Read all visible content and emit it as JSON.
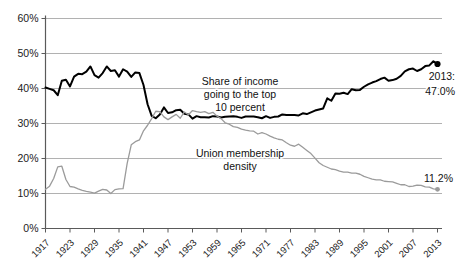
{
  "chart_data": {
    "type": "line",
    "title": "",
    "xlabel": "",
    "ylabel": "",
    "ylim": [
      0,
      60
    ],
    "xlim": [
      1917,
      2013
    ],
    "grid": true,
    "y_tick_labels": [
      "0%",
      "10%",
      "20%",
      "30%",
      "40%",
      "50%",
      "60%"
    ],
    "y_ticks": [
      0,
      10,
      20,
      30,
      40,
      50,
      60
    ],
    "x_ticks": [
      1917,
      1923,
      1929,
      1935,
      1941,
      1947,
      1953,
      1959,
      1965,
      1971,
      1977,
      1983,
      1989,
      1995,
      2001,
      2007,
      2013
    ],
    "x_tick_labels": [
      "1917",
      "1923",
      "1929",
      "1935",
      "1941",
      "1947",
      "1953",
      "1959",
      "1965",
      "1971",
      "1977",
      "1983",
      "1989",
      "1995",
      "2001",
      "2007",
      "2013"
    ],
    "legend_position": "inline-annotations",
    "series": [
      {
        "name": "Share of income going to the top 10 percent",
        "color": "#000000",
        "width": 2.0,
        "annotation": "Share of income\ngoing to the top\n10 percent",
        "end_marker": true,
        "end_label": [
          "2013:",
          "47.0%"
        ],
        "x": [
          1917,
          1918,
          1919,
          1920,
          1921,
          1922,
          1923,
          1924,
          1925,
          1926,
          1927,
          1928,
          1929,
          1930,
          1931,
          1932,
          1933,
          1934,
          1935,
          1936,
          1937,
          1938,
          1939,
          1940,
          1941,
          1942,
          1943,
          1944,
          1945,
          1946,
          1947,
          1948,
          1949,
          1950,
          1951,
          1952,
          1953,
          1954,
          1955,
          1956,
          1957,
          1958,
          1959,
          1960,
          1961,
          1962,
          1963,
          1964,
          1965,
          1966,
          1967,
          1968,
          1969,
          1970,
          1971,
          1972,
          1973,
          1974,
          1975,
          1976,
          1977,
          1978,
          1979,
          1980,
          1981,
          1982,
          1983,
          1984,
          1985,
          1986,
          1987,
          1988,
          1989,
          1990,
          1991,
          1992,
          1993,
          1994,
          1995,
          1996,
          1997,
          1998,
          1999,
          2000,
          2001,
          2002,
          2003,
          2004,
          2005,
          2006,
          2007,
          2008,
          2009,
          2010,
          2011,
          2012,
          2013
        ],
        "values": [
          40.3,
          39.9,
          39.5,
          38.1,
          42.2,
          42.5,
          40.6,
          43.4,
          44.2,
          44.1,
          44.8,
          46.3,
          43.8,
          43.1,
          44.4,
          46.3,
          45.0,
          45.2,
          43.4,
          45.5,
          44.8,
          43.3,
          44.6,
          44.4,
          41.0,
          35.5,
          32.2,
          31.5,
          32.6,
          34.6,
          33.0,
          33.2,
          33.8,
          33.9,
          32.8,
          32.6,
          31.4,
          32.1,
          31.8,
          31.8,
          31.7,
          32.1,
          32.0,
          31.7,
          31.9,
          32.0,
          32.1,
          31.9,
          31.6,
          32.0,
          32.0,
          32.0,
          31.8,
          31.5,
          32.1,
          31.6,
          31.9,
          32.0,
          32.6,
          32.4,
          32.4,
          32.4,
          32.3,
          32.9,
          32.7,
          33.2,
          33.7,
          34.0,
          34.3,
          37.2,
          36.5,
          38.6,
          38.5,
          38.8,
          38.4,
          39.8,
          39.5,
          39.6,
          40.5,
          41.2,
          41.7,
          42.1,
          42.7,
          43.1,
          42.2,
          42.4,
          42.8,
          43.6,
          44.9,
          45.5,
          45.7,
          45.0,
          45.5,
          46.4,
          46.6,
          47.8,
          47.0
        ]
      },
      {
        "name": "Union membership density",
        "color": "#9b9b9b",
        "width": 1.3,
        "annotation": "Union membership\ndensity",
        "end_marker": true,
        "end_label": [
          "11.2%"
        ],
        "x": [
          1917,
          1918,
          1919,
          1920,
          1921,
          1922,
          1923,
          1924,
          1925,
          1926,
          1927,
          1928,
          1929,
          1930,
          1931,
          1932,
          1933,
          1934,
          1935,
          1936,
          1937,
          1938,
          1939,
          1940,
          1941,
          1942,
          1943,
          1944,
          1945,
          1946,
          1947,
          1948,
          1949,
          1950,
          1951,
          1952,
          1953,
          1954,
          1955,
          1956,
          1957,
          1958,
          1959,
          1960,
          1961,
          1962,
          1963,
          1964,
          1965,
          1966,
          1967,
          1968,
          1969,
          1970,
          1971,
          1972,
          1973,
          1974,
          1975,
          1976,
          1977,
          1978,
          1979,
          1980,
          1981,
          1982,
          1983,
          1984,
          1985,
          1986,
          1987,
          1988,
          1989,
          1990,
          1991,
          1992,
          1993,
          1994,
          1995,
          1996,
          1997,
          1998,
          1999,
          2000,
          2001,
          2002,
          2003,
          2004,
          2005,
          2006,
          2007,
          2008,
          2009,
          2010,
          2011,
          2012,
          2013
        ],
        "values": [
          11.2,
          12.1,
          14.3,
          17.6,
          17.8,
          14.0,
          12.0,
          11.8,
          11.3,
          10.9,
          10.6,
          10.4,
          10.1,
          10.7,
          11.2,
          11.0,
          10.0,
          11.1,
          11.3,
          11.4,
          18.6,
          23.9,
          24.8,
          25.3,
          27.9,
          29.5,
          31.4,
          33.5,
          33.4,
          31.9,
          31.1,
          31.9,
          32.6,
          31.5,
          33.3,
          32.5,
          33.7,
          33.4,
          33.2,
          33.4,
          32.8,
          33.2,
          32.1,
          31.4,
          30.2,
          29.8,
          29.1,
          28.9,
          28.4,
          28.1,
          27.9,
          27.8,
          27.0,
          27.4,
          27.0,
          26.4,
          25.9,
          25.5,
          25.3,
          24.5,
          23.8,
          23.5,
          24.1,
          23.2,
          22.3,
          21.4,
          20.1,
          18.8,
          18.0,
          17.5,
          17.0,
          16.8,
          16.4,
          16.1,
          16.1,
          15.8,
          15.8,
          15.5,
          14.9,
          14.5,
          14.1,
          13.9,
          13.9,
          13.5,
          13.4,
          13.3,
          12.9,
          12.5,
          12.5,
          12.0,
          12.1,
          12.4,
          12.3,
          11.9,
          11.8,
          11.3,
          11.2
        ]
      }
    ]
  },
  "axes": {
    "y_labels": [
      "60%",
      "50%",
      "40%",
      "30%",
      "20%",
      "10%",
      "0%"
    ],
    "x_labels": [
      "1917",
      "1923",
      "1929",
      "1935",
      "1941",
      "1947",
      "1953",
      "1959",
      "1965",
      "1971",
      "1977",
      "1983",
      "1989",
      "1995",
      "2001",
      "2007",
      "2013"
    ]
  },
  "annotations": {
    "income_line1": "Share of income",
    "income_line2": "going to the top",
    "income_line3": "10 percent",
    "union_line1": "Union membership",
    "union_line2": "density",
    "black_end_line1": "2013:",
    "black_end_line2": "47.0%",
    "gray_end_line1": "11.2%"
  },
  "colors": {
    "income_series": "#000000",
    "union_series": "#9b9b9b",
    "gridline": "#a8a8a8",
    "axis": "#5a5a5a",
    "background": "#ffffff"
  }
}
